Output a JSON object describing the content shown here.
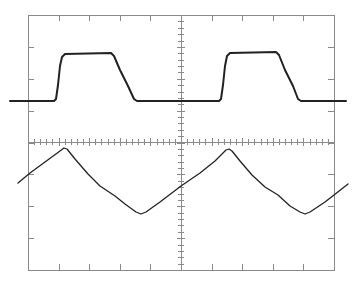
{
  "figure": {
    "graticule": {
      "x_divisions": 10,
      "y_divisions": 8,
      "minor_ticks_per_division": 5,
      "frame": {
        "left": 28,
        "top": 15,
        "right": 334,
        "bottom": 270
      },
      "center": {
        "x": 181,
        "y": 142
      }
    },
    "colors": {
      "trace": "#222222",
      "graticule": "#8a8a8a",
      "background": "#ffffff"
    }
  },
  "chart_data": {
    "type": "line",
    "title": "",
    "xlabel": "",
    "ylabel": "",
    "grid": false,
    "series": [
      {
        "name": "square-pulse-trace",
        "points": [
          [
            10,
            101
          ],
          [
            54,
            101
          ],
          [
            56,
            99
          ],
          [
            58,
            85
          ],
          [
            60,
            66
          ],
          [
            62,
            57
          ],
          [
            65,
            54
          ],
          [
            111,
            53
          ],
          [
            114,
            56
          ],
          [
            120,
            70
          ],
          [
            128,
            86
          ],
          [
            134,
            99
          ],
          [
            137,
            101
          ],
          [
            219,
            101
          ],
          [
            221,
            99
          ],
          [
            223,
            85
          ],
          [
            225,
            66
          ],
          [
            227,
            56
          ],
          [
            230,
            53
          ],
          [
            276,
            52
          ],
          [
            279,
            55
          ],
          [
            285,
            70
          ],
          [
            293,
            86
          ],
          [
            298,
            99
          ],
          [
            301,
            101
          ],
          [
            346,
            101
          ]
        ]
      },
      {
        "name": "triangle-response-trace",
        "points": [
          [
            18,
            183
          ],
          [
            30,
            173
          ],
          [
            45,
            162
          ],
          [
            60,
            151
          ],
          [
            64,
            148
          ],
          [
            67,
            149
          ],
          [
            75,
            159
          ],
          [
            88,
            174
          ],
          [
            100,
            186
          ],
          [
            115,
            196
          ],
          [
            125,
            204
          ],
          [
            136,
            212
          ],
          [
            141,
            214
          ],
          [
            146,
            212
          ],
          [
            160,
            202
          ],
          [
            181,
            186
          ],
          [
            200,
            173
          ],
          [
            215,
            161
          ],
          [
            226,
            150
          ],
          [
            229,
            149
          ],
          [
            232,
            151
          ],
          [
            240,
            161
          ],
          [
            252,
            175
          ],
          [
            265,
            187
          ],
          [
            278,
            195
          ],
          [
            290,
            206
          ],
          [
            300,
            212
          ],
          [
            305,
            214
          ],
          [
            310,
            212
          ],
          [
            325,
            202
          ],
          [
            334,
            195
          ],
          [
            348,
            184
          ]
        ]
      }
    ]
  }
}
